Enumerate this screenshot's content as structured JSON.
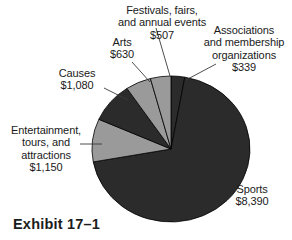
{
  "exhibit": {
    "caption": "Exhibit 17–1"
  },
  "labels": {
    "festivals": "Festivals, fairs,\nand annual events\n$507",
    "associations": "Associations\nand membership\norganizations\n$339",
    "arts": "Arts\n$630",
    "causes": "Causes\n$1,080",
    "entertainment": "Entertainment,\ntours, and\nattractions\n$1,150",
    "sports": "Sports\n$8,390"
  },
  "colors": {
    "dark_slice": "#2b2b2b",
    "light_slice": "#9a9a9a",
    "slice_outline": "#000000",
    "leader_line": "#3a3a3a",
    "text": "#1a1a1a",
    "background": "#ffffff"
  },
  "chart_data": {
    "type": "pie",
    "title": "Exhibit 17–1",
    "unit": "$ millions",
    "total": 12096,
    "categories": [
      "Associations and membership organizations",
      "Sports",
      "Entertainment, tours, and attractions",
      "Causes",
      "Arts",
      "Festivals, fairs, and annual events"
    ],
    "values": [
      339,
      8390,
      1150,
      1080,
      630,
      507
    ],
    "value_labels": [
      "$339",
      "$8,390",
      "$1,150",
      "$1,080",
      "$630",
      "$507"
    ],
    "slices": [
      {
        "name": "Associations and membership organizations",
        "value": 339,
        "label": "$339",
        "color": "#2b2b2b",
        "start_angle": 0.0,
        "end_angle": 10.1
      },
      {
        "name": "Sports",
        "value": 8390,
        "label": "$8,390",
        "color": "#2b2b2b",
        "start_angle": 10.1,
        "end_angle": 259.8
      },
      {
        "name": "Entertainment, tours, and attractions",
        "value": 1150,
        "label": "$1,150",
        "color": "#9a9a9a",
        "start_angle": 259.8,
        "end_angle": 294.0
      },
      {
        "name": "Causes",
        "value": 1080,
        "label": "$1,080",
        "color": "#2b2b2b",
        "start_angle": 294.0,
        "end_angle": 326.1
      },
      {
        "name": "Arts",
        "value": 630,
        "label": "$630",
        "color": "#9a9a9a",
        "start_angle": 326.1,
        "end_angle": 344.9
      },
      {
        "name": "Festivals, fairs, and annual events",
        "value": 507,
        "label": "$507",
        "color": "#9a9a9a",
        "start_angle": 344.9,
        "end_angle": 360.0
      }
    ],
    "legend": "none",
    "grid": false,
    "labels_position": "outside-with-leader-lines"
  }
}
